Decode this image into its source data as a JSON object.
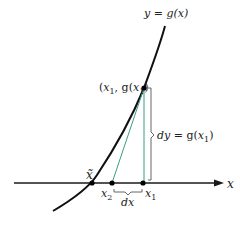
{
  "diagram": {
    "curve_label": "y = g(x)",
    "point_label": "(x1, g(x1))",
    "point_label_parts": {
      "open": "(",
      "x": "x",
      "sub1": "1",
      "comma": ", g(",
      "x2": "x",
      "sub2": "1",
      "close": ")"
    },
    "dy_label": {
      "dy": "dy",
      "eq": " = g(",
      "x": "x",
      "sub": "1",
      "close": ")"
    },
    "axis_label": "x",
    "root_label": "x̃",
    "x2_label": {
      "x": "x",
      "sub": "2"
    },
    "x1_label": {
      "x": "x",
      "sub": "1"
    },
    "dx_label": "dx",
    "colors": {
      "curve": "#111111",
      "axis": "#1a1a1a",
      "tangent": "#3f9a86",
      "vertical": "#3f9a86",
      "brace": "#555555",
      "points": "#000000"
    }
  }
}
